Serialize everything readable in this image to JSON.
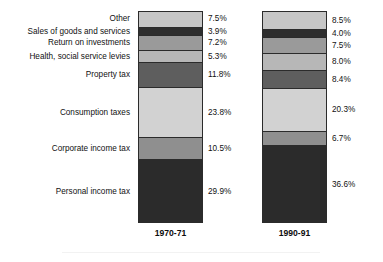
{
  "chart_data": {
    "type": "bar",
    "subtype": "stacked-bar-100-percent",
    "title": "",
    "xlabel": "",
    "ylabel": "",
    "ylim": [
      0,
      100
    ],
    "grid": false,
    "legend_position": "none",
    "value_suffix": "%",
    "categories": [
      "1970-71",
      "1990-91"
    ],
    "stack_order": "top-to-bottom",
    "series": [
      {
        "name": "Other",
        "color": "#c6c6c6",
        "values": [
          7.5,
          8.5
        ],
        "labels": [
          "7.5%",
          "8.5%"
        ]
      },
      {
        "name": "Sales of goods and services",
        "color": "#2e2e2e",
        "values": [
          3.9,
          4.0
        ],
        "labels": [
          "3.9%",
          "4.0%"
        ]
      },
      {
        "name": "Return on investments",
        "color": "#9a9a9a",
        "values": [
          7.2,
          7.5
        ],
        "labels": [
          "7.2%",
          "7.5%"
        ]
      },
      {
        "name": "Health, social service levies",
        "color": "#b7b7b7",
        "values": [
          5.3,
          8.0
        ],
        "labels": [
          "5.3%",
          "8.0%"
        ]
      },
      {
        "name": "Property tax",
        "color": "#5e5e5e",
        "values": [
          11.8,
          8.4
        ],
        "labels": [
          "11.8%",
          "8.4%"
        ]
      },
      {
        "name": "Consumption taxes",
        "color": "#d2d2d2",
        "values": [
          23.8,
          20.3
        ],
        "labels": [
          "23.8%",
          "20.3%"
        ]
      },
      {
        "name": "Corporate income tax",
        "color": "#8f8f8f",
        "values": [
          10.5,
          6.7
        ],
        "labels": [
          "10.5%",
          "6.7%"
        ]
      },
      {
        "name": "Personal income tax",
        "color": "#2b2b2b",
        "values": [
          29.9,
          36.6
        ],
        "labels": [
          "29.9%",
          "36.6%"
        ]
      }
    ]
  },
  "colors": {
    "background": "#ffffff",
    "outline": "#2b2b2b",
    "text": "#111111"
  }
}
